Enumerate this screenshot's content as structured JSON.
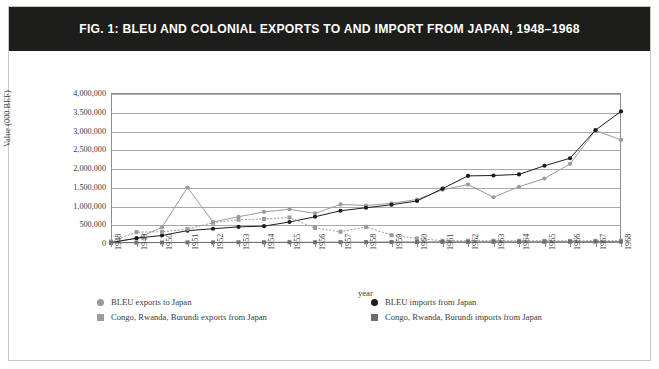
{
  "figure": {
    "title": "FIG. 1: BLEU AND COLONIAL EXPORTS TO AND IMPORT FROM JAPAN, 1948–1968",
    "title_bar_color": "#1d1d1b",
    "background_color": "#ffffff",
    "border_color": "#c9c6c0"
  },
  "colors": {
    "gray_series": "#9b9b9b",
    "black_series": "#1d1d1b",
    "gridline": "#a8a8a8",
    "axis": "#8d8d8d",
    "text": "#3b3b3b"
  },
  "legend": {
    "position": "bottom",
    "items": [
      {
        "label": "BLEU exports to Japan",
        "marker": "circle",
        "color": "#9b9b9b",
        "icon": "circle-marker-icon"
      },
      {
        "label": "BLEU imports from Japan",
        "marker": "circle",
        "color": "#1d1d1b",
        "icon": "circle-marker-icon"
      },
      {
        "label": "Congo, Rwanda, Burundi exports from Japan",
        "marker": "square",
        "color": "#9b9b9b",
        "icon": "square-marker-icon"
      },
      {
        "label": "Congo, Rwanda, Burundi imports from Japan",
        "marker": "square",
        "color": "#6e6e6e",
        "icon": "square-marker-icon"
      }
    ]
  },
  "chart_data": {
    "type": "line",
    "title": "FIG. 1: BLEU AND COLONIAL EXPORTS TO AND IMPORT FROM JAPAN, 1948–1968",
    "xlabel": "year",
    "ylabel": "Value (000 BEF)",
    "grid": true,
    "xlim": [
      1948,
      1968
    ],
    "ylim": [
      0,
      4000000
    ],
    "ytick_step": 500000,
    "ytick_labels": [
      "0",
      "500,000",
      "1,000,000",
      "1,500,000",
      "2,000,000",
      "2,500,000",
      "3,000,000",
      "3,500,000",
      "4,000,000"
    ],
    "ytick_values": [
      0,
      500000,
      1000000,
      1500000,
      2000000,
      2500000,
      3000000,
      3500000,
      4000000
    ],
    "categories": [
      1948,
      1949,
      1950,
      1951,
      1952,
      1953,
      1954,
      1955,
      1956,
      1957,
      1958,
      1959,
      1960,
      1961,
      1962,
      1963,
      1964,
      1965,
      1966,
      1967,
      1968
    ],
    "xtick_labels": [
      "1948",
      "1949",
      "1950",
      "1951",
      "1952",
      "1953",
      "1954",
      "1955",
      "1956",
      "1957",
      "1958",
      "1959",
      "1960",
      "1961",
      "1962",
      "1963",
      "1964",
      "1965",
      "1966",
      "1967",
      "1968"
    ],
    "series": [
      {
        "name": "BLEU exports to Japan",
        "color": "#9b9b9b",
        "marker": "circle",
        "linestyle": "solid",
        "values": [
          20000,
          120000,
          420000,
          1480000,
          560000,
          700000,
          830000,
          900000,
          790000,
          1030000,
          1000000,
          1060000,
          1160000,
          1420000,
          1560000,
          1220000,
          1500000,
          1720000,
          2110000,
          3000000,
          2750000
        ]
      },
      {
        "name": "BLEU imports from Japan",
        "color": "#1d1d1b",
        "marker": "circle",
        "linestyle": "solid",
        "values": [
          10000,
          130000,
          200000,
          330000,
          380000,
          430000,
          450000,
          560000,
          700000,
          860000,
          940000,
          1020000,
          1120000,
          1450000,
          1790000,
          1800000,
          1830000,
          2060000,
          2260000,
          3010000,
          3510000
        ]
      },
      {
        "name": "Congo, Rwanda, Burundi exports from Japan",
        "color": "#9b9b9b",
        "marker": "square",
        "linestyle": "dotted",
        "values": [
          40000,
          290000,
          300000,
          370000,
          540000,
          620000,
          640000,
          680000,
          400000,
          300000,
          430000,
          210000,
          120000,
          60000,
          60000,
          60000,
          60000,
          60000,
          60000,
          60000,
          60000
        ]
      },
      {
        "name": "Congo, Rwanda, Burundi imports from Japan",
        "color": "#6e6e6e",
        "marker": "square",
        "linestyle": "solid",
        "values": [
          5000,
          10000,
          12000,
          15000,
          15000,
          18000,
          18000,
          20000,
          20000,
          22000,
          22000,
          25000,
          25000,
          28000,
          28000,
          30000,
          30000,
          32000,
          32000,
          35000,
          35000
        ]
      }
    ]
  }
}
